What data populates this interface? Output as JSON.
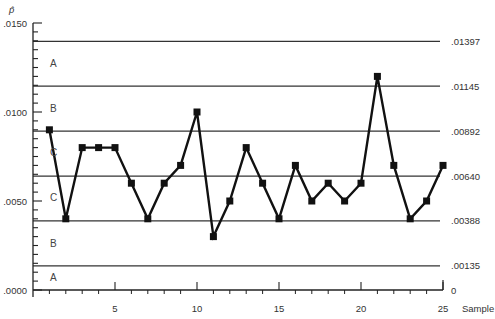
{
  "chart_data": {
    "type": "line",
    "title": "",
    "subtitle": "",
    "chart_kind": "p control chart",
    "xlabel": "Sample",
    "ylabel": "p̂",
    "x": [
      1,
      2,
      3,
      4,
      5,
      6,
      7,
      8,
      9,
      10,
      11,
      12,
      13,
      14,
      15,
      16,
      17,
      18,
      19,
      20,
      21,
      22,
      23,
      24,
      25
    ],
    "series": [
      {
        "name": "p̂",
        "marker": "square",
        "values": [
          0.009,
          0.004,
          0.008,
          0.008,
          0.008,
          0.006,
          0.004,
          0.006,
          0.007,
          0.01,
          0.003,
          0.005,
          0.008,
          0.006,
          0.004,
          0.007,
          0.005,
          0.006,
          0.005,
          0.006,
          0.012,
          0.007,
          0.004,
          0.005,
          0.007
        ]
      }
    ],
    "xlim": [
      0,
      25
    ],
    "ylim": [
      0.0,
      0.015
    ],
    "x_ticks": [
      5,
      10,
      15,
      20,
      25
    ],
    "y_ticks": [
      {
        "value": 0.015,
        "label": ".0150"
      },
      {
        "value": 0.01,
        "label": ".0100"
      },
      {
        "value": 0.005,
        "label": ".0050"
      },
      {
        "value": 0.0,
        "label": ".0000"
      }
    ],
    "reference_lines": [
      {
        "value": 0.01397,
        "label": ".01397"
      },
      {
        "value": 0.01145,
        "label": ".01145"
      },
      {
        "value": 0.00892,
        "label": ".00892"
      },
      {
        "value": 0.0064,
        "label": ".00640"
      },
      {
        "value": 0.00388,
        "label": ".00388"
      },
      {
        "value": 0.00135,
        "label": ".00135"
      },
      {
        "value": 0.0,
        "label": "0"
      }
    ],
    "zone_labels": [
      {
        "label": "A",
        "value": 0.0127
      },
      {
        "label": "B",
        "value": 0.0102
      },
      {
        "label": "C",
        "value": 0.0077
      },
      {
        "label": "C",
        "value": 0.0052
      },
      {
        "label": "B",
        "value": 0.0026
      },
      {
        "label": "A",
        "value": 0.0007
      }
    ],
    "grid": false,
    "legend": "none"
  }
}
